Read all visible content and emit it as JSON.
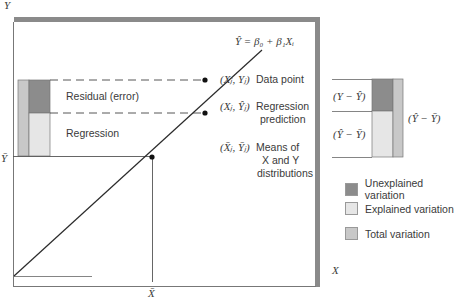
{
  "axes": {
    "y_label": "Y",
    "x_label": "X",
    "y_mean_label": "Ȳ",
    "x_mean_label": "X̄"
  },
  "equation": "Ŷ = β₀ + β₁Xᵢ",
  "points": {
    "data_point": {
      "coords": "(Xⱼ, Yⱼ)",
      "label": "Data point"
    },
    "regression_prediction": {
      "coords": "(Xⱼ, Ŷⱼ)",
      "label_line1": "Regression",
      "label_line2": "prediction"
    },
    "means": {
      "coords": "(X̄ⱼ, Ȳⱼ)",
      "label_line1": "Means of",
      "label_line2": "X and Y",
      "label_line3": "distributions"
    }
  },
  "left_bar": {
    "residual_label": "Residual (error)",
    "regression_label": "Regression"
  },
  "right_bar": {
    "unexplained_expr": "(Y − Ŷ)",
    "explained_expr": "(Ŷ − Ȳ)",
    "total_expr": "(Ŷ − Ȳ)"
  },
  "legend": [
    {
      "label": "Unexplained variation",
      "color": "#8c8c8c"
    },
    {
      "label": "Explained variation",
      "color": "#e6e6e6"
    },
    {
      "label": "Total variation",
      "color": "#c8c8c8"
    }
  ],
  "colors": {
    "unexplained": "#8c8c8c",
    "explained": "#e6e6e6",
    "total": "#c8c8c8",
    "frame_shadow": "#8a8a8a",
    "line": "#2a2a2a"
  }
}
